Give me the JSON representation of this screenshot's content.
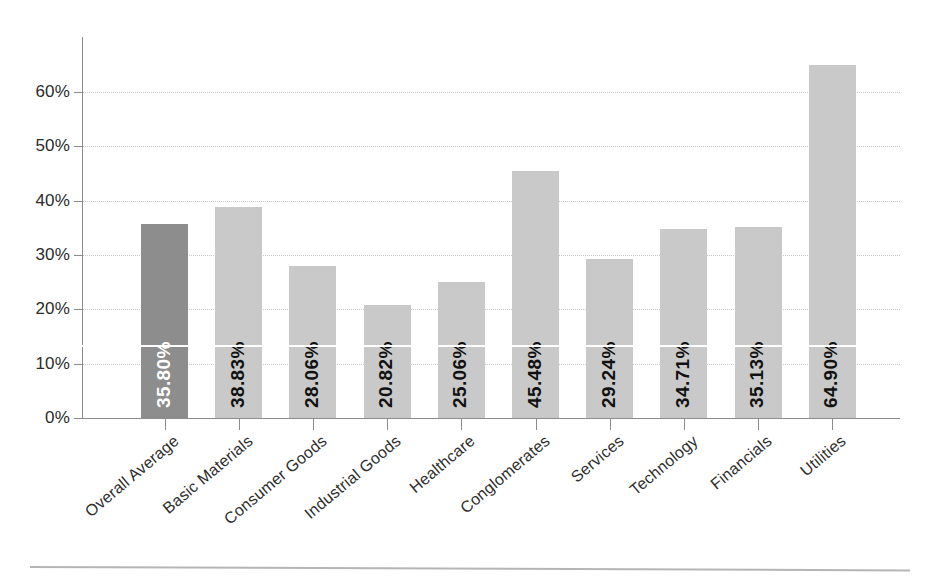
{
  "chart_data": {
    "type": "bar",
    "title": "",
    "subtitle": "",
    "xlabel": "",
    "ylabel": "",
    "ylim": [
      0,
      70
    ],
    "grid": true,
    "legend": "none",
    "orientation": "vertical",
    "value_label_position": "inside-bottom-rotated",
    "categories": [
      "Overall Average",
      "Basic Materials",
      "Consumer Goods",
      "Industrial Goods",
      "Healthcare",
      "Conglomerates",
      "Services",
      "Technology",
      "Financials",
      "Utilities"
    ],
    "values": [
      35.8,
      38.83,
      28.06,
      20.82,
      25.06,
      45.48,
      29.24,
      34.71,
      35.13,
      64.9
    ],
    "value_labels": [
      "35.80%",
      "38.83%",
      "28.06%",
      "20.82%",
      "25.06%",
      "45.48%",
      "29.24%",
      "34.71%",
      "35.13%",
      "64.90%"
    ],
    "yticks": [
      0,
      10,
      20,
      30,
      40,
      50,
      60
    ],
    "ytick_labels": [
      "0%",
      "10%",
      "20%",
      "30%",
      "40%",
      "50%",
      "60%"
    ],
    "highlight_index": 0,
    "colors": {
      "bar": "#c9c9c9",
      "bar_highlight": "#8d8d8d",
      "axis": "#8c8c8c",
      "grid": "#c9c9c9",
      "text": "#2b2b2b",
      "value_label": "#111111",
      "value_label_highlight": "#ffffff",
      "background": "#ffffff"
    }
  }
}
